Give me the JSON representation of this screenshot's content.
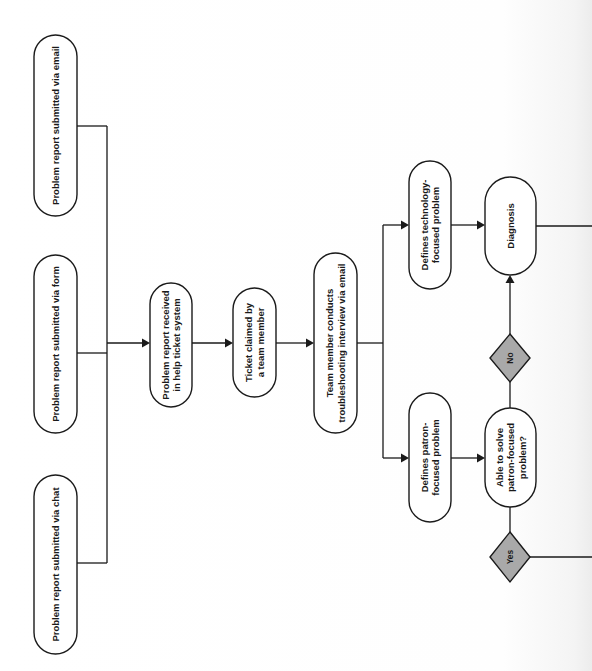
{
  "diagram": {
    "orientation": "rotated-90-ccw",
    "colors": {
      "stroke": "#1a1a1a",
      "node_fill": "#ffffff",
      "decision_fill": "#a9a9a9",
      "background": "#ffffff"
    },
    "nodes": [
      {
        "id": "email",
        "type": "terminal",
        "x": 34,
        "y": 35,
        "w": 43,
        "h": 181,
        "lines": [
          "Problem report submitted via email"
        ]
      },
      {
        "id": "form",
        "type": "terminal",
        "x": 34,
        "y": 255,
        "w": 43,
        "h": 178,
        "lines": [
          "Problem report submitted via form"
        ]
      },
      {
        "id": "chat",
        "type": "terminal",
        "x": 34,
        "y": 475,
        "w": 43,
        "h": 179,
        "lines": [
          "Problem report submitted via chat"
        ]
      },
      {
        "id": "received",
        "type": "terminal",
        "x": 150,
        "y": 283,
        "w": 42,
        "h": 124,
        "lines": [
          "Problem report received",
          "in help ticket system"
        ]
      },
      {
        "id": "claimed",
        "type": "terminal",
        "x": 233,
        "y": 288,
        "w": 43,
        "h": 109,
        "lines": [
          "Ticket claimed by",
          "a team member"
        ]
      },
      {
        "id": "interview",
        "type": "terminal",
        "x": 314,
        "y": 253,
        "w": 43,
        "h": 180,
        "lines": [
          "Team member conducts",
          "troubleshooting interview via email"
        ]
      },
      {
        "id": "tech",
        "type": "terminal",
        "x": 409,
        "y": 161,
        "w": 42,
        "h": 128,
        "lines": [
          "Defines technology-",
          "focused problem"
        ]
      },
      {
        "id": "patron",
        "type": "terminal",
        "x": 409,
        "y": 393,
        "w": 42,
        "h": 129,
        "lines": [
          "Defines patron-",
          "focused problem"
        ]
      },
      {
        "id": "diagnosis",
        "type": "terminal",
        "x": 485,
        "y": 177,
        "w": 51,
        "h": 98,
        "lines": [
          "Diagnosis"
        ]
      },
      {
        "id": "able",
        "type": "terminal",
        "x": 485,
        "y": 408,
        "w": 51,
        "h": 99,
        "lines": [
          "Able to solve",
          "patron-focused",
          "problem?"
        ]
      }
    ],
    "decisions": [
      {
        "id": "no",
        "cx": 510,
        "cy": 358,
        "hw": 20,
        "hh": 24,
        "label": "No"
      },
      {
        "id": "yes",
        "cx": 510,
        "cy": 557,
        "hw": 20,
        "hh": 25,
        "label": "Yes"
      }
    ],
    "edges": [
      {
        "id": "email-to-bus",
        "points": [
          [
            77,
            126
          ],
          [
            107,
            126
          ]
        ],
        "arrow": false
      },
      {
        "id": "form-to-bus",
        "points": [
          [
            77,
            353
          ],
          [
            107,
            353
          ]
        ],
        "arrow": false
      },
      {
        "id": "chat-to-bus",
        "points": [
          [
            77,
            563
          ],
          [
            107,
            563
          ]
        ],
        "arrow": false
      },
      {
        "id": "bus-vertical",
        "points": [
          [
            107,
            126
          ],
          [
            107,
            563
          ]
        ],
        "arrow": false
      },
      {
        "id": "bus-to-received",
        "points": [
          [
            107,
            343
          ],
          [
            150,
            343
          ]
        ],
        "arrow": true
      },
      {
        "id": "received-to-claimed",
        "points": [
          [
            192,
            343
          ],
          [
            233,
            343
          ]
        ],
        "arrow": true
      },
      {
        "id": "claimed-to-interview",
        "points": [
          [
            276,
            343
          ],
          [
            314,
            343
          ]
        ],
        "arrow": true
      },
      {
        "id": "interview-to-branch",
        "points": [
          [
            357,
            343
          ],
          [
            383,
            343
          ]
        ],
        "arrow": false
      },
      {
        "id": "branch-vertical",
        "points": [
          [
            383,
            225
          ],
          [
            383,
            458
          ]
        ],
        "arrow": false
      },
      {
        "id": "branch-to-tech",
        "points": [
          [
            383,
            225
          ],
          [
            409,
            225
          ]
        ],
        "arrow": true
      },
      {
        "id": "branch-to-patron",
        "points": [
          [
            383,
            458
          ],
          [
            409,
            458
          ]
        ],
        "arrow": true
      },
      {
        "id": "tech-to-diagnosis",
        "points": [
          [
            451,
            225
          ],
          [
            485,
            225
          ]
        ],
        "arrow": true
      },
      {
        "id": "patron-to-able",
        "points": [
          [
            451,
            458
          ],
          [
            485,
            458
          ]
        ],
        "arrow": true
      },
      {
        "id": "able-to-no",
        "points": [
          [
            510,
            408
          ],
          [
            510,
            382
          ]
        ],
        "arrow": false
      },
      {
        "id": "no-to-diagnosis",
        "points": [
          [
            510,
            334
          ],
          [
            510,
            275
          ]
        ],
        "arrow": true
      },
      {
        "id": "able-to-yes",
        "points": [
          [
            510,
            507
          ],
          [
            510,
            532
          ]
        ],
        "arrow": false
      },
      {
        "id": "yes-continues",
        "points": [
          [
            530,
            557
          ],
          [
            592,
            557
          ]
        ],
        "arrow": false
      },
      {
        "id": "diagnosis-continues",
        "points": [
          [
            536,
            226
          ],
          [
            592,
            226
          ]
        ],
        "arrow": false
      }
    ]
  }
}
